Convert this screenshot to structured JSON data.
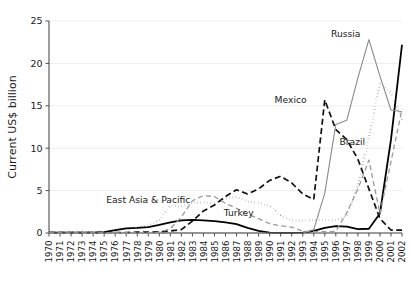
{
  "chart_data": {
    "type": "line",
    "title": "",
    "subtitle": "",
    "xlabel": "",
    "ylabel": "Current US$ billion",
    "ylim": [
      0,
      25
    ],
    "yticks": [
      0,
      5,
      10,
      15,
      20,
      25
    ],
    "ytick_labels": [
      "0",
      "5",
      "10",
      "15",
      "20",
      "25"
    ],
    "grid": "horizontal",
    "legend_position": "inline-annotations",
    "x": [
      1970,
      1971,
      1972,
      1973,
      1974,
      1975,
      1976,
      1977,
      1978,
      1979,
      1980,
      1981,
      1982,
      1983,
      1984,
      1985,
      1986,
      1987,
      1988,
      1989,
      1990,
      1991,
      1992,
      1993,
      1994,
      1995,
      1996,
      1997,
      1998,
      1999,
      2000,
      2001,
      2002
    ],
    "xtick_labels": [
      "1970",
      "1971",
      "1972",
      "1973",
      "1974",
      "1975",
      "1976",
      "1977",
      "1978",
      "1979",
      "1980",
      "1981",
      "1982",
      "1983",
      "1984",
      "1985",
      "1986",
      "1987",
      "1988",
      "1989",
      "1990",
      "1991",
      "1992",
      "1993",
      "1994",
      "1995",
      "1996",
      "1997",
      "1998",
      "1999",
      "2000",
      "2001",
      "2002"
    ],
    "series": [
      {
        "name": "East Asia & Pacific",
        "label": "East Asia & Pacific",
        "style": "dotted",
        "color": "#111111",
        "width": 2.0,
        "dash": "0.2,3.1",
        "label_x": 1979.0,
        "label_y": 3.55,
        "values": [
          0.15,
          0.15,
          0.15,
          0.15,
          0.12,
          0.15,
          0.3,
          0.45,
          0.7,
          0.9,
          1.5,
          3.25,
          3.1,
          3.6,
          3.6,
          3.5,
          4.1,
          4.25,
          3.7,
          3.55,
          3.2,
          2.1,
          1.5,
          1.45,
          1.55,
          1.5,
          1.5,
          2.0,
          5.6,
          11.3,
          17.6,
          16.5,
          13.4
        ]
      },
      {
        "name": "Turkey",
        "label": "Turkey",
        "style": "solid-thick",
        "color": "#000000",
        "width": 1.8,
        "dash": "none",
        "label_x": 1987.2,
        "label_y": 2.05,
        "values": [
          0.05,
          0.05,
          0.05,
          0.05,
          0.05,
          0.1,
          0.35,
          0.55,
          0.6,
          0.7,
          0.95,
          1.25,
          1.5,
          1.55,
          1.5,
          1.4,
          1.25,
          1.05,
          0.6,
          0.25,
          0.05,
          0.02,
          0.02,
          0.05,
          0.25,
          0.6,
          0.8,
          0.75,
          0.45,
          0.5,
          2.3,
          11.0,
          22.2
        ]
      },
      {
        "name": "Mexico",
        "label": "Mexico",
        "style": "dashed-heavy",
        "color": "#111111",
        "width": 1.7,
        "dash": "6,3.4",
        "label_x": 1991.9,
        "label_y": 15.3,
        "values": [
          0.05,
          0.05,
          0.05,
          0.05,
          0.05,
          0.05,
          0.05,
          0.05,
          0.1,
          0.1,
          0.15,
          0.25,
          0.4,
          1.4,
          2.6,
          3.3,
          4.3,
          5.1,
          4.6,
          5.2,
          6.2,
          6.7,
          5.9,
          4.6,
          3.95,
          15.7,
          12.2,
          11.0,
          8.7,
          5.2,
          1.7,
          0.35,
          0.35
        ]
      },
      {
        "name": "Russia",
        "label": "Russia",
        "style": "solid-thin",
        "color": "#8a8a8a",
        "width": 1.1,
        "dash": "none",
        "label_x": 1996.9,
        "label_y": 23.1,
        "values": [
          0,
          0,
          0,
          0,
          0,
          0,
          0,
          0,
          0,
          0,
          0,
          0,
          0,
          0,
          0,
          0,
          0,
          0,
          0,
          0,
          0,
          0,
          0,
          0,
          0.4,
          4.7,
          12.8,
          13.3,
          18.3,
          22.8,
          18.5,
          14.5,
          14.3
        ]
      },
      {
        "name": "Brazil",
        "label": "Brazil",
        "style": "dashed-light",
        "color": "#9a9a9a",
        "width": 1.3,
        "dash": "5,3.2",
        "label_x": 1997.5,
        "label_y": 10.4,
        "values": [
          0,
          0,
          0,
          0,
          0,
          0,
          0,
          0,
          0,
          0,
          0.1,
          0.5,
          1.9,
          3.8,
          4.4,
          4.3,
          3.5,
          2.9,
          2.2,
          1.7,
          1.1,
          0.85,
          0.7,
          0.2,
          0.15,
          0.15,
          0.2,
          2.4,
          5.2,
          8.6,
          2.3,
          8.4,
          14.6
        ]
      }
    ]
  }
}
